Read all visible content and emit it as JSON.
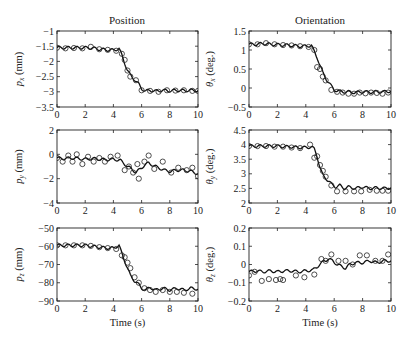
{
  "columns": {
    "left_title": "Position",
    "right_title": "Orientation"
  },
  "xlabel": "Time (s)",
  "chart_data": [
    {
      "type": "line",
      "id": "px",
      "title": "Position",
      "xlabel": "",
      "ylabel": "p_x (mm)",
      "ylabel_main": "p",
      "ylabel_sub": "x",
      "ylabel_unit": " (mm)",
      "xlim": [
        0,
        10
      ],
      "ylim": [
        -3.5,
        -1
      ],
      "xticks": [
        0,
        2,
        4,
        6,
        8,
        10
      ],
      "yticks": [
        -1,
        -1.5,
        -2,
        -2.5,
        -3,
        -3.5
      ],
      "series": [
        {
          "name": "model",
          "style": "line",
          "x": [
            0,
            0.5,
            1,
            1.5,
            2,
            2.5,
            3,
            3.5,
            4,
            4.4,
            4.6,
            4.8,
            5,
            5.2,
            5.5,
            5.8,
            6,
            6.3,
            6.6,
            7,
            7.5,
            8,
            8.5,
            9,
            9.5,
            10
          ],
          "values": [
            -1.55,
            -1.55,
            -1.55,
            -1.55,
            -1.55,
            -1.56,
            -1.6,
            -1.62,
            -1.63,
            -1.58,
            -1.8,
            -2.05,
            -2.3,
            -2.45,
            -2.6,
            -2.75,
            -2.9,
            -2.98,
            -2.95,
            -2.98,
            -2.95,
            -2.97,
            -2.95,
            -2.96,
            -2.95,
            -2.96
          ]
        },
        {
          "name": "measured",
          "style": "circle",
          "x": [
            0,
            0.6,
            1.2,
            1.8,
            2.4,
            3,
            3.6,
            4.2,
            4.6,
            4.8,
            5,
            5.2,
            5.6,
            6,
            6.6,
            7.2,
            7.8,
            8.4,
            9,
            9.6,
            10
          ],
          "values": [
            -1.55,
            -1.57,
            -1.56,
            -1.57,
            -1.52,
            -1.6,
            -1.62,
            -1.65,
            -1.75,
            -1.95,
            -2.3,
            -2.5,
            -2.62,
            -2.95,
            -2.97,
            -3.0,
            -2.95,
            -2.96,
            -2.95,
            -2.97,
            -2.97
          ]
        }
      ]
    },
    {
      "type": "line",
      "id": "thx",
      "title": "Orientation",
      "xlabel": "",
      "ylabel": "θ_x (deg.)",
      "ylabel_main": "θ",
      "ylabel_sub": "x",
      "ylabel_unit": " (deg.)",
      "xlim": [
        0,
        10
      ],
      "ylim": [
        -0.5,
        1.5
      ],
      "xticks": [
        0,
        2,
        4,
        6,
        8,
        10
      ],
      "yticks": [
        1.5,
        1,
        0.5,
        0,
        -0.5
      ],
      "series": [
        {
          "name": "model",
          "style": "line",
          "x": [
            0,
            0.5,
            1,
            1.5,
            2,
            2.5,
            3,
            3.5,
            4,
            4.4,
            4.6,
            4.8,
            5,
            5.2,
            5.5,
            5.8,
            6,
            6.3,
            6.6,
            7,
            7.5,
            8,
            8.5,
            9,
            9.5,
            10
          ],
          "values": [
            1.15,
            1.15,
            1.17,
            1.15,
            1.14,
            1.13,
            1.12,
            1.1,
            1.1,
            1.12,
            0.95,
            0.8,
            0.6,
            0.4,
            0.2,
            0.05,
            -0.05,
            -0.08,
            -0.1,
            -0.1,
            -0.12,
            -0.1,
            -0.11,
            -0.1,
            -0.1,
            -0.08
          ]
        },
        {
          "name": "measured",
          "style": "circle",
          "x": [
            0,
            0.6,
            1.2,
            1.8,
            2.4,
            3,
            3.6,
            4.2,
            4.6,
            4.8,
            5,
            5.2,
            5.4,
            5.8,
            6.2,
            6.6,
            7,
            7.4,
            7.8,
            8.2,
            8.6,
            9,
            9.4,
            9.8
          ],
          "values": [
            1.15,
            1.15,
            1.18,
            1.15,
            1.13,
            1.12,
            1.1,
            1.08,
            1.0,
            0.55,
            0.5,
            0.3,
            0.2,
            -0.05,
            -0.1,
            -0.12,
            -0.15,
            -0.15,
            -0.12,
            -0.14,
            -0.12,
            -0.13,
            -0.15,
            -0.12
          ]
        }
      ]
    },
    {
      "type": "line",
      "id": "py",
      "title": "",
      "xlabel": "",
      "ylabel": "p_y (mm)",
      "ylabel_main": "p",
      "ylabel_sub": "y",
      "ylabel_unit": " (mm)",
      "xlim": [
        0,
        10
      ],
      "ylim": [
        -4,
        2
      ],
      "xticks": [
        0,
        2,
        4,
        6,
        8,
        10
      ],
      "yticks": [
        2,
        0,
        -2,
        -4
      ],
      "series": [
        {
          "name": "model",
          "style": "line",
          "x": [
            0,
            0.5,
            1,
            1.5,
            2,
            2.5,
            3,
            3.5,
            4,
            4.5,
            4.8,
            5,
            5.3,
            5.6,
            5.9,
            6.2,
            6.5,
            6.8,
            7.2,
            7.6,
            8,
            8.5,
            9,
            9.5,
            10
          ],
          "values": [
            -0.3,
            -0.35,
            -0.3,
            -0.35,
            -0.4,
            -0.35,
            -0.4,
            -0.45,
            -0.4,
            -0.5,
            -0.8,
            -1.0,
            -1.2,
            -1.5,
            -1.2,
            -0.9,
            -0.7,
            -0.9,
            -1.1,
            -1.3,
            -1.4,
            -1.3,
            -1.3,
            -1.4,
            -1.6
          ]
        },
        {
          "name": "measured",
          "style": "circle",
          "x": [
            0,
            0.4,
            0.8,
            1.1,
            1.4,
            1.8,
            2.2,
            2.6,
            3,
            3.4,
            3.8,
            4.3,
            4.8,
            5.1,
            5.4,
            5.7,
            5.8,
            6.2,
            6.5,
            6.9,
            7.5,
            8.1,
            8.6,
            9.2,
            9.6,
            10
          ],
          "values": [
            -0.3,
            -0.6,
            -0.1,
            -0.6,
            0.0,
            -0.8,
            -0.2,
            -0.6,
            -0.3,
            -0.6,
            -0.2,
            -0.1,
            -1.3,
            -1.0,
            -1.5,
            -0.8,
            -2.0,
            -0.6,
            -0.1,
            -1.2,
            -0.6,
            -1.5,
            -1.1,
            -1.3,
            -1.1,
            -1.8
          ]
        }
      ]
    },
    {
      "type": "line",
      "id": "thy",
      "title": "",
      "xlabel": "",
      "ylabel": "θ_y (deg.)",
      "ylabel_main": "θ",
      "ylabel_sub": "y",
      "ylabel_unit": " (deg.)",
      "xlim": [
        0,
        10
      ],
      "ylim": [
        2,
        4.5
      ],
      "xticks": [
        0,
        2,
        4,
        6,
        8,
        10
      ],
      "yticks": [
        4.5,
        4,
        3.5,
        3,
        2.5,
        2
      ],
      "series": [
        {
          "name": "model",
          "style": "line",
          "x": [
            0,
            0.5,
            1,
            1.5,
            2,
            2.5,
            3,
            3.5,
            4,
            4.4,
            4.6,
            4.8,
            5,
            5.2,
            5.5,
            5.8,
            6.1,
            6.4,
            6.7,
            7,
            7.5,
            8,
            8.5,
            9,
            9.5,
            10
          ],
          "values": [
            3.95,
            3.95,
            3.95,
            3.95,
            3.95,
            3.93,
            3.92,
            3.9,
            3.9,
            3.92,
            3.85,
            3.6,
            3.2,
            2.95,
            2.8,
            2.65,
            2.55,
            2.6,
            2.5,
            2.55,
            2.5,
            2.55,
            2.5,
            2.52,
            2.5,
            2.52
          ]
        },
        {
          "name": "measured",
          "style": "circle",
          "x": [
            0,
            0.6,
            1.2,
            1.8,
            2.4,
            3,
            3.6,
            4.3,
            4.6,
            4.8,
            5,
            5.2,
            5.4,
            5.8,
            6.2,
            6.8,
            7.4,
            7.9,
            8.5,
            9,
            9.4,
            9.8
          ],
          "values": [
            3.95,
            3.95,
            3.95,
            3.93,
            3.93,
            3.9,
            3.88,
            4.0,
            3.55,
            3.6,
            3.3,
            3.1,
            2.9,
            2.6,
            2.4,
            2.4,
            2.4,
            2.4,
            2.45,
            2.42,
            2.42,
            2.42
          ]
        }
      ]
    },
    {
      "type": "line",
      "id": "pz",
      "title": "",
      "xlabel": "Time (s)",
      "ylabel": "p_z (mm)",
      "ylabel_main": "p",
      "ylabel_sub": "z",
      "ylabel_unit": " (mm)",
      "xlim": [
        0,
        10
      ],
      "ylim": [
        -90,
        -50
      ],
      "xticks": [
        0,
        2,
        4,
        6,
        8,
        10
      ],
      "yticks": [
        -50,
        -60,
        -70,
        -80,
        -90
      ],
      "series": [
        {
          "name": "model",
          "style": "line",
          "x": [
            0,
            0.5,
            1,
            1.5,
            2,
            2.5,
            3,
            3.5,
            4,
            4.4,
            4.6,
            4.8,
            5,
            5.2,
            5.5,
            5.8,
            6,
            6.3,
            6.6,
            7,
            7.5,
            8,
            8.5,
            9,
            9.5,
            10
          ],
          "values": [
            -59.5,
            -59.5,
            -59.5,
            -59.5,
            -59.5,
            -60,
            -60.5,
            -61,
            -61,
            -59.5,
            -64,
            -68,
            -72,
            -76,
            -79,
            -81,
            -83,
            -84,
            -82.5,
            -84,
            -83,
            -84,
            -83,
            -84,
            -83,
            -83.5
          ]
        },
        {
          "name": "measured",
          "style": "circle",
          "x": [
            0,
            0.6,
            1.2,
            1.8,
            2.4,
            3,
            3.6,
            4.2,
            4.6,
            4.8,
            5,
            5.2,
            5.5,
            5.8,
            6.2,
            6.6,
            7,
            7.5,
            8,
            8.5,
            9,
            9.6
          ],
          "values": [
            -59.5,
            -59.5,
            -59.5,
            -59.5,
            -59.8,
            -60.5,
            -61,
            -61.5,
            -65,
            -66,
            -69,
            -72,
            -77,
            -80,
            -83,
            -84,
            -85,
            -84,
            -85,
            -85,
            -85.5,
            -86
          ]
        }
      ]
    },
    {
      "type": "line",
      "id": "thz",
      "title": "",
      "xlabel": "Time (s)",
      "ylabel": "θ_z (deg.)",
      "ylabel_main": "θ",
      "ylabel_sub": "z",
      "ylabel_unit": " (deg.)",
      "xlim": [
        0,
        10
      ],
      "ylim": [
        -0.2,
        0.2
      ],
      "xticks": [
        0,
        2,
        4,
        6,
        8,
        10
      ],
      "yticks": [
        0.2,
        0.1,
        0,
        -0.1,
        -0.2
      ],
      "series": [
        {
          "name": "model",
          "style": "line",
          "x": [
            0,
            0.5,
            1,
            1.5,
            2,
            2.5,
            3,
            3.5,
            4,
            4.5,
            5,
            5.3,
            5.6,
            5.9,
            6.2,
            6.5,
            6.8,
            7.1,
            7.5,
            8,
            8.5,
            9,
            9.5,
            10
          ],
          "values": [
            -0.04,
            -0.035,
            -0.04,
            -0.035,
            -0.04,
            -0.035,
            -0.035,
            -0.04,
            -0.035,
            -0.03,
            0.0,
            0.02,
            0.03,
            0.02,
            0.0,
            -0.01,
            -0.02,
            0.0,
            0.01,
            0.01,
            0.02,
            0.01,
            0.02,
            0.02
          ]
        },
        {
          "name": "measured",
          "style": "circle",
          "x": [
            0,
            0.4,
            0.9,
            1.4,
            1.9,
            2.2,
            2.4,
            3.3,
            3.9,
            4.6,
            5.1,
            5.4,
            5.8,
            6.3,
            6.8,
            7.3,
            7.8,
            8.3,
            8.9,
            9.4,
            9.8
          ],
          "values": [
            -0.06,
            -0.04,
            -0.09,
            -0.08,
            -0.085,
            -0.08,
            -0.085,
            -0.06,
            -0.07,
            -0.055,
            0.03,
            0.02,
            0.055,
            0.02,
            0.02,
            0.0,
            0.05,
            0.05,
            0.02,
            0.02,
            0.055
          ]
        }
      ]
    }
  ]
}
